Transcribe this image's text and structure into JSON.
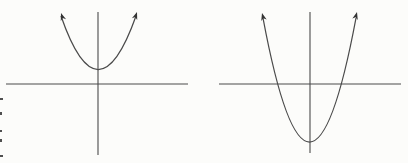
{
  "figure": {
    "canvas": {
      "width": 408,
      "height": 163,
      "background": "#fcfcfa",
      "line_color": "#4a4a4a",
      "arrow_color": "#333333",
      "artifact_color": "#4f4f4f"
    },
    "diagrams": [
      {
        "name": "parabola-vertex-above-x-axis",
        "description": "Upward-opening parabola whose vertex lies above the x-axis; the curve does not cross the x-axis",
        "x_axis": {
          "y": 84,
          "x1": 6,
          "x2": 188
        },
        "y_axis": {
          "x": 98,
          "y1": 12,
          "y2": 155
        },
        "curve": {
          "start": [
            61,
            16
          ],
          "control": [
            98,
            123
          ],
          "end": [
            136,
            16
          ]
        },
        "vertex": [
          98,
          68
        ],
        "x_intercepts": [],
        "arrows": [
          {
            "tip": [
              61,
              13
            ],
            "angle": -19
          },
          {
            "tip": [
              137,
              12
            ],
            "angle": 19
          }
        ]
      },
      {
        "name": "parabola-vertex-below-x-axis",
        "description": "Upward-opening parabola whose vertex lies below the x-axis; the curve crosses the x-axis at two points",
        "x_axis": {
          "y": 84,
          "x1": 219,
          "x2": 401
        },
        "y_axis": {
          "x": 310,
          "y1": 12,
          "y2": 153
        },
        "curve": {
          "start": [
            263,
            18
          ],
          "control": [
            309.5,
            266
          ],
          "end": [
            356,
            18
          ]
        },
        "vertex": [
          309,
          142
        ],
        "x_intercepts": [
          279,
          347
        ],
        "arrows": [
          {
            "tip": [
              262,
              13
            ],
            "angle": -15
          },
          {
            "tip": [
              357,
              12
            ],
            "angle": 15
          }
        ]
      }
    ],
    "edge_artifacts": [
      {
        "x": 0,
        "y": 98,
        "w": 3,
        "h": 2
      },
      {
        "x": 0,
        "y": 112,
        "w": 2,
        "h": 3
      },
      {
        "x": 0,
        "y": 130,
        "w": 2,
        "h": 2
      },
      {
        "x": 0,
        "y": 139,
        "w": 2,
        "h": 3
      },
      {
        "x": 0,
        "y": 155,
        "w": 3,
        "h": 2
      }
    ]
  }
}
